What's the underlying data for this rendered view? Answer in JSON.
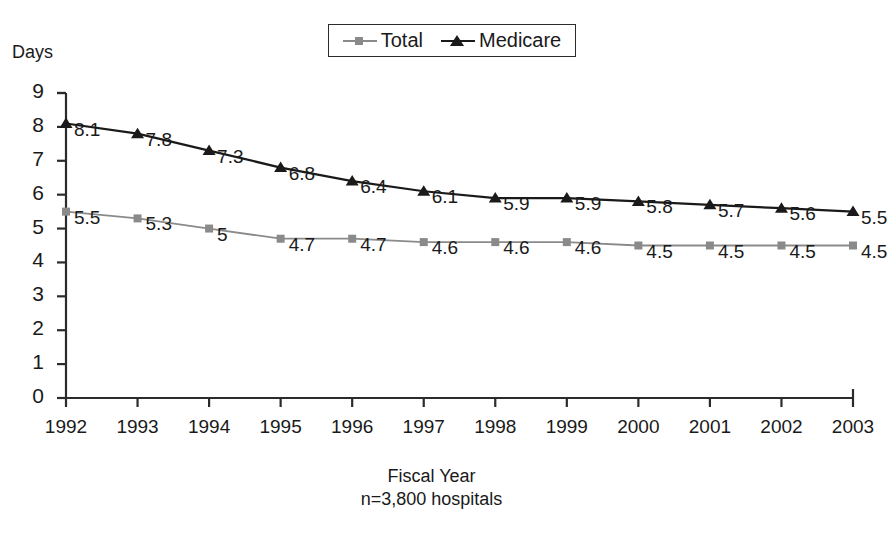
{
  "axis_title": "Days",
  "caption": {
    "xlabel": "Fiscal Year",
    "note": "n=3,800 hospitals"
  },
  "legend": {
    "entries": [
      {
        "label": "Total",
        "marker": "square-marker",
        "color": "#8a8a8a"
      },
      {
        "label": "Medicare",
        "marker": "triangle-marker",
        "color": "#1a1a1a"
      }
    ]
  },
  "chart_data": {
    "type": "line",
    "title": "",
    "subtitle": "",
    "xlabel": "Fiscal Year",
    "ylabel": "Days",
    "annotation": "n=3,800 hospitals",
    "grid": false,
    "legend_position": "top-center",
    "xlim": [
      1992,
      2003
    ],
    "ylim": [
      0,
      9
    ],
    "yticks": [
      0,
      1,
      2,
      3,
      4,
      5,
      6,
      7,
      8,
      9
    ],
    "ytick_labels": [
      "0",
      "1",
      "2",
      "3",
      "4",
      "5",
      "6",
      "7",
      "8",
      "9"
    ],
    "categories": [
      1992,
      1993,
      1994,
      1995,
      1996,
      1997,
      1998,
      1999,
      2000,
      2001,
      2002,
      2003
    ],
    "xtick_labels": [
      "1992",
      "1993",
      "1994",
      "1995",
      "1996",
      "1997",
      "1998",
      "1999",
      "2000",
      "2001",
      "2002",
      "2003"
    ],
    "series": [
      {
        "name": "Total",
        "color": "#8a8a8a",
        "marker": "square",
        "values": [
          5.5,
          5.3,
          5.0,
          4.7,
          4.7,
          4.6,
          4.6,
          4.6,
          4.5,
          4.5,
          4.5,
          4.5
        ],
        "data_labels": [
          "5.5",
          "5.3",
          "5",
          "4.7",
          "4.7",
          "4.6",
          "4.6",
          "4.6",
          "4.5",
          "4.5",
          "4.5",
          "4.5"
        ]
      },
      {
        "name": "Medicare",
        "color": "#1a1a1a",
        "marker": "triangle",
        "values": [
          8.1,
          7.8,
          7.3,
          6.8,
          6.4,
          6.1,
          5.9,
          5.9,
          5.8,
          5.7,
          5.6,
          5.5
        ],
        "data_labels": [
          "8.1",
          "7.8",
          "7.3",
          "6.8",
          "6.4",
          "6.1",
          "5.9",
          "5.9",
          "5.8",
          "5.7",
          "5.6",
          "5.5"
        ]
      }
    ]
  }
}
